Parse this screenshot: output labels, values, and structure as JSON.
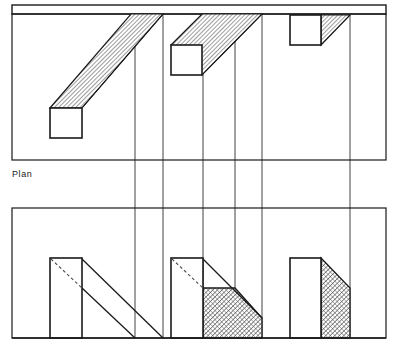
{
  "drawing": {
    "title": "Plan",
    "labels": [
      {
        "name": "plan-label",
        "text": "Plan",
        "x": 12,
        "y": 177
      }
    ],
    "colors": {
      "ink": "#1a1a1a",
      "thin_ink": "#3a3a3a",
      "hatch": "#555555",
      "paper": "#ffffff",
      "hidden_line": "#4a4a4a"
    },
    "frames": {
      "top_band": {
        "x": 12,
        "y": 5,
        "width": 374,
        "height": 9
      },
      "plan_box": {
        "x": 12,
        "y": 14,
        "width": 374,
        "height": 146
      },
      "elevation_box": {
        "x": 12,
        "y": 208,
        "width": 374,
        "height": 130
      }
    },
    "projection_lines": {
      "description": "vertical projector lines linking plan to elevation",
      "x_positions": [
        135,
        163,
        203,
        235,
        262,
        350
      ],
      "y_top": 14,
      "y_bottom": 338
    },
    "plan_view": {
      "squares": [
        {
          "name": "square-1",
          "x": 50,
          "y": 108,
          "width": 32,
          "height": 30
        },
        {
          "name": "square-2",
          "x": 171,
          "y": 45,
          "width": 31,
          "height": 30
        },
        {
          "name": "square-3",
          "x": 290,
          "y": 15,
          "width": 31,
          "height": 30
        }
      ],
      "prisms": [
        {
          "name": "prism-1",
          "hatched": true,
          "points": "50,108 131,14 163,14 82,108"
        },
        {
          "name": "prism-2",
          "hatched": true,
          "points": "171,45 202,14 262,14 202,75"
        },
        {
          "name": "prism-3",
          "hatched": true,
          "points": "321,15 350,15 321,45"
        }
      ],
      "ridge_lines": [
        {
          "name": "ridge-1",
          "x1": 82,
          "y1": 108,
          "x2": 163,
          "y2": 14
        }
      ]
    },
    "elevation_view": {
      "shapes": [
        {
          "name": "elevation-shape-1",
          "rect": {
            "x": 50,
            "y": 258,
            "width": 32,
            "height": 80
          },
          "hidden_diagonal": {
            "x1": 51,
            "y1": 259,
            "x2": 82,
            "y2": 288
          },
          "slope_lines": [
            {
              "x1": 82,
              "y1": 259,
              "x2": 163,
              "y2": 338
            },
            {
              "x1": 82,
              "y1": 288,
              "x2": 135,
              "y2": 338
            }
          ],
          "hatched_region": null
        },
        {
          "name": "elevation-shape-2",
          "rect": {
            "x": 171,
            "y": 258,
            "width": 32,
            "height": 80
          },
          "hidden_diagonal": {
            "x1": 172,
            "y1": 259,
            "x2": 203,
            "y2": 288
          },
          "slope_lines": [
            {
              "x1": 203,
              "y1": 259,
              "x2": 262,
              "y2": 318
            }
          ],
          "hatched_region": {
            "points": "203,288 235,288 262,318 262,338 203,338"
          }
        },
        {
          "name": "elevation-shape-3",
          "rect": {
            "x": 290,
            "y": 258,
            "width": 31,
            "height": 80
          },
          "hidden_diagonal": null,
          "slope_lines": [],
          "hatched_region": {
            "points": "321,258 350,288 350,338 321,338"
          }
        }
      ]
    }
  }
}
